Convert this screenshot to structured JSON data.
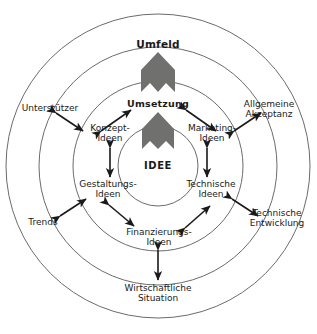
{
  "diagram": {
    "title": "Umfeld",
    "rings": [
      {
        "name": "outer-ring",
        "label": "Umfeld"
      },
      {
        "name": "middle-ring",
        "label": "Umsetzung"
      },
      {
        "name": "inner-ring",
        "label": "IDEE"
      }
    ],
    "center_label": "IDEE",
    "middle_label": "Umsetzung",
    "outer_label": "Umfeld",
    "inner_nodes": [
      {
        "id": "konzept",
        "line1": "Konzept-",
        "line2": "Ideen"
      },
      {
        "id": "marketing",
        "line1": "Marketing-",
        "line2": "Ideen"
      },
      {
        "id": "technische",
        "line1": "Technische",
        "line2": "Ideen"
      },
      {
        "id": "finanzierungs",
        "line1": "Finanzierungs-",
        "line2": "Ideen"
      },
      {
        "id": "gestaltungs",
        "line1": "Gestaltungs-",
        "line2": "Ideen"
      }
    ],
    "outer_nodes": [
      {
        "id": "unterstuetzer",
        "line1": "Unterstützer",
        "line2": ""
      },
      {
        "id": "allgemeine-akzeptanz",
        "line1": "Allgemeine",
        "line2": "Akzeptanz"
      },
      {
        "id": "technische-entwicklung",
        "line1": "Technische",
        "line2": "Entwicklung"
      },
      {
        "id": "wirtschaftliche-situation",
        "line1": "Wirtschaftliche",
        "line2": "Situation"
      },
      {
        "id": "trends",
        "line1": "Trends",
        "line2": ""
      }
    ],
    "chevrons": [
      {
        "id": "chevron-outer",
        "meaning": "upward-arrow-outer"
      },
      {
        "id": "chevron-inner",
        "meaning": "upward-arrow-inner"
      }
    ],
    "colors": {
      "ring_stroke": "#6b6b6b",
      "chevron_fill": "#70706f",
      "arrow": "#1a1a1a",
      "text": "#1a1a1a",
      "background": "#ffffff"
    }
  }
}
